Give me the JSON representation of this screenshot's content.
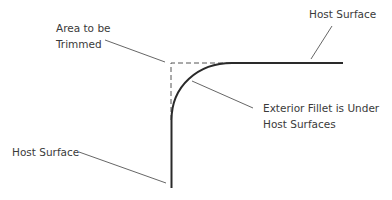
{
  "diagram": {
    "labels": {
      "area_trimmed_line1": "Area to be",
      "area_trimmed_line2": "Trimmed",
      "host_surface_top": "Host Surface",
      "fillet_line1": "Exterior Fillet is Under",
      "fillet_line2": "Host Surfaces",
      "host_surface_left": "Host Surface"
    },
    "colors": {
      "surface_stroke": "#2a2a2a",
      "leader_stroke": "#555555",
      "dash_stroke": "#555555",
      "text": "#3a3a3a",
      "background": "#ffffff"
    }
  }
}
